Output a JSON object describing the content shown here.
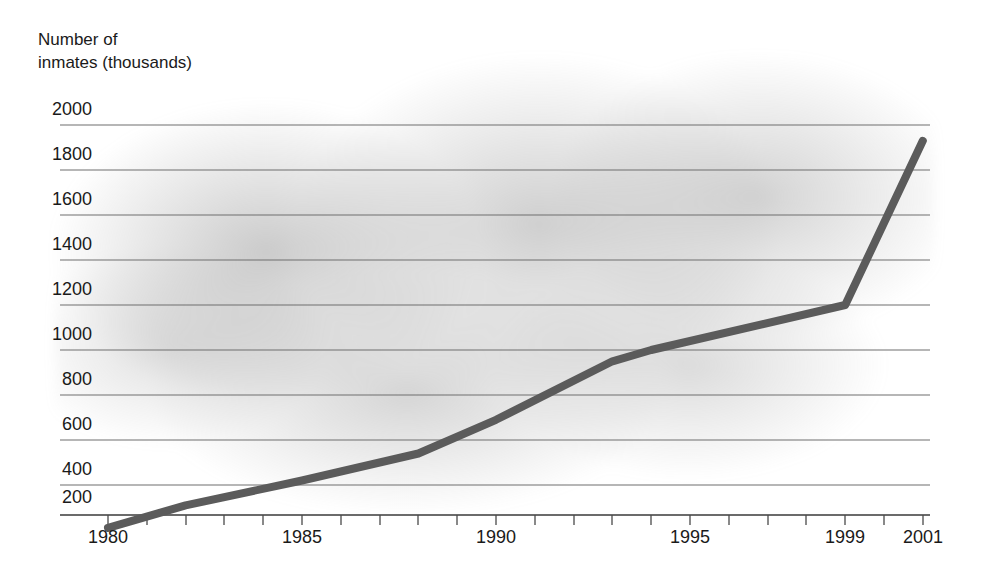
{
  "chart_data": {
    "type": "line",
    "title": "",
    "ylabel": "Number of\ninmates (thousands)",
    "xlabel": "",
    "x": [
      1980,
      1982,
      1985,
      1988,
      1990,
      1993,
      1994,
      1999,
      2001
    ],
    "values": [
      210,
      310,
      420,
      540,
      690,
      950,
      1000,
      1200,
      1930
    ],
    "series": [
      {
        "name": "Number of inmates (thousands)",
        "values": [
          210,
          310,
          420,
          540,
          690,
          950,
          1000,
          1200,
          1930
        ]
      }
    ],
    "ylim": [
      0,
      2000
    ],
    "xlim": [
      1979,
      2002
    ],
    "y_ticks": [
      200,
      400,
      600,
      800,
      1000,
      1200,
      1400,
      1600,
      1800,
      2000
    ],
    "y_tick_labels": [
      "200",
      "400",
      "600",
      "800",
      "1000",
      "1200",
      "1400",
      "1600",
      "1800",
      "2000"
    ],
    "x_ticks": [
      1980,
      1981,
      1982,
      1983,
      1984,
      1985,
      1986,
      1987,
      1988,
      1989,
      1990,
      1991,
      1992,
      1993,
      1994,
      1995,
      1996,
      1997,
      1998,
      1999,
      2000,
      2001
    ],
    "x_tick_labels": [
      {
        "value": 1980,
        "label": "1980"
      },
      {
        "value": 1985,
        "label": "1985"
      },
      {
        "value": 1990,
        "label": "1990"
      },
      {
        "value": 1995,
        "label": "1995"
      },
      {
        "value": 1999,
        "label": "1999"
      },
      {
        "value": 2001,
        "label": "2001"
      }
    ],
    "grid": "horizontal",
    "legend": "none",
    "line_color": "#5b5b5b",
    "gridline_color": "#6e6e6e",
    "background_color": "#ffffff",
    "plot_shading_color": "#969696"
  }
}
